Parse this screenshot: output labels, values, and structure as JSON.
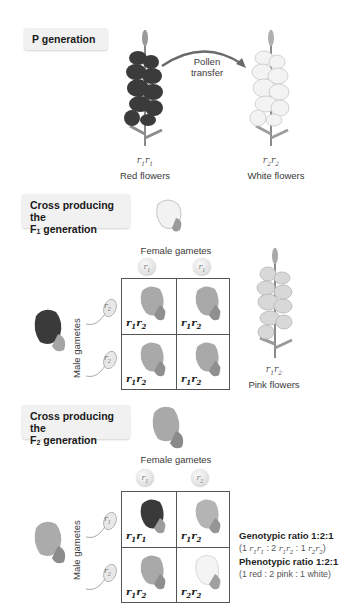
{
  "p_generation": {
    "header": "P generation",
    "arrow_label_line1": "Pollen",
    "arrow_label_line2": "transfer",
    "parents": [
      {
        "genotype_a": "r",
        "sub_a": "1",
        "genotype_b": "r",
        "sub_b": "1",
        "label": "Red flowers",
        "color": "#3a3a3a"
      },
      {
        "genotype_a": "r",
        "sub_a": "2",
        "genotype_b": "r",
        "sub_b": "2",
        "label": "White flowers",
        "color": "#f2f2f2"
      }
    ]
  },
  "f1_cross": {
    "header_line1": "Cross producing the",
    "header_line2_prefix": "F",
    "header_line2_sub": "1",
    "header_line2_suffix": " generation",
    "female_gametes_label": "Female gametes",
    "male_gametes_label": "Male gametes",
    "female_gametes": [
      {
        "allele": "r",
        "sub": "1"
      },
      {
        "allele": "r",
        "sub": "1"
      }
    ],
    "male_gametes": [
      {
        "allele": "r",
        "sub": "2"
      },
      {
        "allele": "r",
        "sub": "2"
      }
    ],
    "cells": [
      {
        "a": "r",
        "sa": "1",
        "b": "r",
        "sb": "2",
        "color": "#a9a9a9"
      },
      {
        "a": "r",
        "sa": "1",
        "b": "r",
        "sb": "2",
        "color": "#a9a9a9"
      },
      {
        "a": "r",
        "sa": "1",
        "b": "r",
        "sb": "2",
        "color": "#a9a9a9"
      },
      {
        "a": "r",
        "sa": "1",
        "b": "r",
        "sb": "2",
        "color": "#a9a9a9"
      }
    ],
    "offspring": {
      "genotype_a": "r",
      "sub_a": "1",
      "genotype_b": "r",
      "sub_b": "2",
      "label": "Pink flowers"
    }
  },
  "f2_cross": {
    "header_line1": "Cross producing the",
    "header_line2_prefix": "F",
    "header_line2_sub": "2",
    "header_line2_suffix": " generation",
    "female_gametes_label": "Female gametes",
    "male_gametes_label": "Male gametes",
    "female_gametes": [
      {
        "allele": "r",
        "sub": "1"
      },
      {
        "allele": "r",
        "sub": "2"
      }
    ],
    "male_gametes": [
      {
        "allele": "r",
        "sub": "1"
      },
      {
        "allele": "r",
        "sub": "2"
      }
    ],
    "cells": [
      {
        "a": "r",
        "sa": "1",
        "b": "r",
        "sb": "1",
        "color": "#3a3a3a"
      },
      {
        "a": "r",
        "sa": "1",
        "b": "r",
        "sb": "2",
        "color": "#a9a9a9"
      },
      {
        "a": "r",
        "sa": "1",
        "b": "r",
        "sb": "2",
        "color": "#a9a9a9"
      },
      {
        "a": "r",
        "sa": "2",
        "b": "r",
        "sb": "2",
        "color": "#f0f0f0"
      }
    ],
    "genotypic_ratio_title": "Genotypic ratio 1:2:1",
    "genotypic_ratio_detail": {
      "n1": "1",
      "g1": "r",
      "g1s": "1",
      "g1b": "r",
      "g1bs": "1",
      "n2": "2",
      "g2": "r",
      "g2s": "1",
      "g2b": "r",
      "g2bs": "2",
      "n3": "1",
      "g3": "r",
      "g3s": "2",
      "g3b": "r",
      "g3bs": "2"
    },
    "phenotypic_ratio_title": "Phenotypic ratio 1:2:1",
    "phenotypic_ratio_detail": "(1 red : 2 pink : 1 white)"
  },
  "colors": {
    "red_flower": "#3a3a3a",
    "pink_flower": "#a9a9a9",
    "white_flower": "#f0f0f0",
    "grid_line": "#555555",
    "header_bg": "#f1f1f1"
  }
}
